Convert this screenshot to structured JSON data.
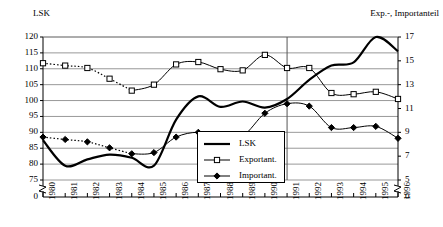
{
  "chart_data": {
    "type": "line",
    "title": "",
    "xlabel": "",
    "ylabel": "LSK",
    "y2label": "Exp.-, Importanteil",
    "grid": true,
    "legend_position": "inside-center",
    "categories": [
      "1980",
      "1981",
      "1982",
      "1983",
      "1984",
      "1985",
      "1986",
      "1987",
      "1988",
      "1989",
      "1990",
      "1991",
      "1992",
      "1993",
      "1994",
      "1995",
      "1996"
    ],
    "ylim": [
      75,
      120
    ],
    "yticks": [
      75,
      80,
      85,
      90,
      95,
      100,
      105,
      110,
      115,
      120
    ],
    "y_axis_break_label": "0",
    "y2lim": [
      5,
      17
    ],
    "y2ticks": [
      5,
      7,
      9,
      11,
      13,
      15,
      17
    ],
    "y2_axis_break_label": "0",
    "annotations": [
      {
        "type": "vertical-line",
        "x": "1991"
      }
    ],
    "series": [
      {
        "name": "LSK",
        "axis": "left",
        "style": "thick-solid",
        "marker": "none",
        "values": [
          87.5,
          79.5,
          81.5,
          83.0,
          82.0,
          79.5,
          94.0,
          101.3,
          98.0,
          99.7,
          97.8,
          100.5,
          106.5,
          111.0,
          112.0,
          120.0,
          115.5
        ]
      },
      {
        "name": "Exportant.",
        "axis": "right",
        "style": "solid-dotted-start",
        "marker": "open-square",
        "values": [
          14.8,
          14.6,
          14.4,
          13.5,
          12.5,
          13.0,
          14.7,
          14.9,
          14.3,
          14.2,
          15.5,
          14.4,
          14.4,
          12.3,
          12.2,
          12.4,
          11.8
        ]
      },
      {
        "name": "Important.",
        "axis": "right",
        "style": "solid-dotted-start",
        "marker": "filled-diamond",
        "values": [
          8.6,
          8.4,
          8.2,
          7.7,
          7.2,
          7.3,
          8.6,
          9.0,
          8.6,
          8.7,
          10.6,
          11.4,
          11.2,
          9.4,
          9.4,
          9.5,
          8.5
        ]
      }
    ]
  },
  "axes": {
    "left_title": "LSK",
    "right_title": "Exp.-, Importanteil"
  },
  "legend": {
    "items": [
      {
        "label": "LSK"
      },
      {
        "label": "Exportant."
      },
      {
        "label": "Important."
      }
    ]
  }
}
